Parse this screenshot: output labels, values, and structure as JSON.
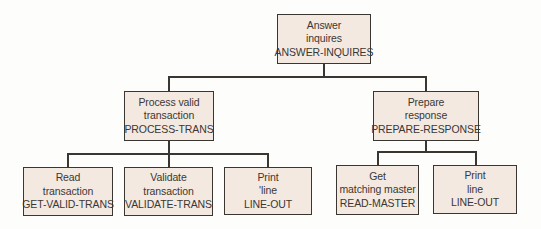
{
  "diagram": {
    "type": "structure-chart",
    "colors": {
      "box_fill": "#f4e9e1",
      "box_border": "#3a3632",
      "text": "#3b3734",
      "background": "#fdfdfc"
    },
    "root": {
      "line1": "Answer",
      "line2": "inquires",
      "module": "ANSWER-INQUIRES"
    },
    "level2": [
      {
        "line1": "Process valid",
        "line2": "transaction",
        "module": "PROCESS-TRANS"
      },
      {
        "line1": "Prepare",
        "line2": "response",
        "module": "PREPARE-RESPONSE"
      }
    ],
    "level3_left": [
      {
        "line1": "Read",
        "line2": "transaction",
        "module": "GET-VALID-TRANS"
      },
      {
        "line1": "Validate",
        "line2": "transaction",
        "module": "VALIDATE-TRANS"
      },
      {
        "line1": "Print",
        "line2": "'line",
        "module": "LINE-OUT"
      }
    ],
    "level3_right": [
      {
        "line1": "Get",
        "line2": "matching master",
        "module": "READ-MASTER"
      },
      {
        "line1": "Print",
        "line2": "line",
        "module": "LINE-OUT"
      }
    ]
  }
}
